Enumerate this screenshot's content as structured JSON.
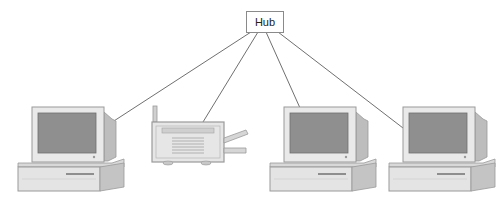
{
  "diagram": {
    "type": "network-star-topology",
    "hub": {
      "label": "Hub"
    },
    "nodes": [
      {
        "id": "computer-1",
        "kind": "computer"
      },
      {
        "id": "printer",
        "kind": "printer"
      },
      {
        "id": "computer-2",
        "kind": "computer"
      },
      {
        "id": "computer-3",
        "kind": "computer"
      }
    ],
    "connections": [
      {
        "from": "hub",
        "to": "computer-1"
      },
      {
        "from": "hub",
        "to": "printer"
      },
      {
        "from": "hub",
        "to": "computer-2"
      },
      {
        "from": "hub",
        "to": "computer-3"
      }
    ],
    "colors": {
      "line": "#5a5a5a",
      "device_body": "#e6e6e6",
      "device_shade": "#c8c8c8",
      "screen": "#8c8c8c",
      "outline": "#9a9a9a"
    }
  }
}
